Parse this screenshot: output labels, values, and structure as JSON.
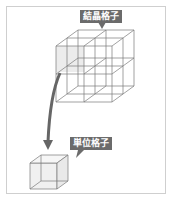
{
  "diagram": {
    "labels": {
      "crystal_lattice": "結晶格子",
      "unit_cell": "単位格子"
    },
    "colors": {
      "line": "#7a7a7a",
      "label_bg": "#6b6b6b",
      "label_text": "#ffffff",
      "arrow": "#666666",
      "highlight_face": "#e8e8e8",
      "frame": "#cfcfcf"
    }
  }
}
